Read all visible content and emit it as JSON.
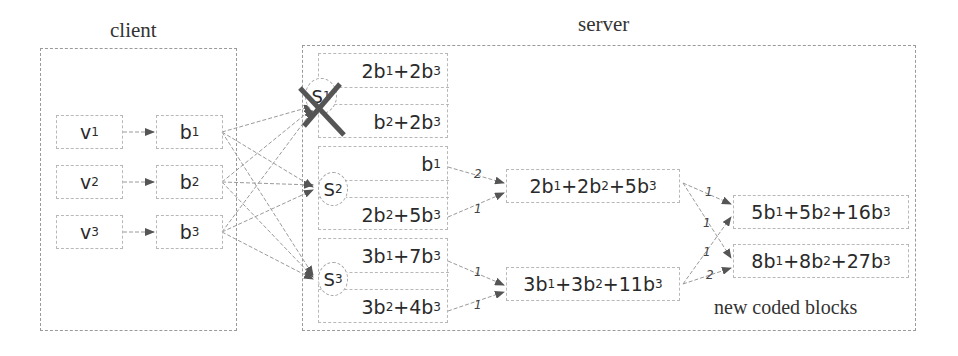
{
  "client": {
    "title": "client",
    "source_blocks": [
      {
        "id": "v1",
        "label": "v",
        "sub": "1"
      },
      {
        "id": "v2",
        "label": "v",
        "sub": "2"
      },
      {
        "id": "v3",
        "label": "v",
        "sub": "3"
      }
    ],
    "encoded_blocks": [
      {
        "id": "b1",
        "label": "b",
        "sub": "1"
      },
      {
        "id": "b2",
        "label": "b",
        "sub": "2"
      },
      {
        "id": "b3",
        "label": "b",
        "sub": "3"
      }
    ]
  },
  "server": {
    "title": "server",
    "storage_nodes": [
      {
        "id": "S1",
        "label": "S",
        "sub": "1",
        "failed": true,
        "blocks": [
          "2b<sub>1</sub>+2b<sub>3</sub>",
          "b<sub>2</sub>+2b<sub>3</sub>"
        ]
      },
      {
        "id": "S2",
        "label": "S",
        "sub": "2",
        "failed": false,
        "blocks": [
          "b<sub>1</sub>",
          "2b<sub>2</sub>+5b<sub>3</sub>"
        ]
      },
      {
        "id": "S3",
        "label": "S",
        "sub": "3",
        "failed": false,
        "blocks": [
          "3b<sub>1</sub>+7b<sub>3</sub>",
          "3b<sub>2</sub>+4b<sub>3</sub>"
        ]
      }
    ],
    "intermediate_blocks": [
      "2b<sub>1</sub>+2b<sub>2</sub>+5b<sub>3</sub>",
      "3b<sub>1</sub>+3b<sub>2</sub>+11b<sub>3</sub>"
    ],
    "new_blocks": [
      "5b<sub>1</sub>+5b<sub>2</sub>+16b<sub>3</sub>",
      "8b<sub>1</sub>+8b<sub>2</sub>+27b<sub>3</sub>"
    ],
    "new_blocks_caption": "new coded blocks",
    "edge_weights": {
      "s2b1_to_mid1": "2",
      "s2b2_to_mid1": "1",
      "s3b1_to_mid2": "1",
      "s3b2_to_mid2": "1",
      "mid1_to_new1": "1",
      "mid1_to_new2": "1",
      "mid2_to_new1": "1",
      "mid2_to_new2": "2"
    }
  },
  "colors": {
    "failure_cross": "#555555",
    "edge": "#9a9a9a",
    "arrowhead": "#555555"
  }
}
